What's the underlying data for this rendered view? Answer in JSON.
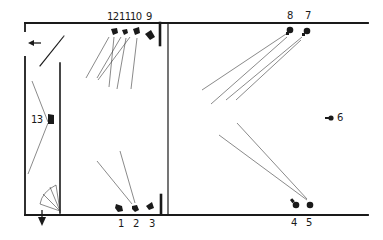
{
  "diagram": {
    "type": "floor-plan-camera-positions",
    "colors": {
      "ink": "#1a1a1a",
      "sight_line": "#3a3a3a",
      "background": "#ffffff"
    },
    "cameras": [
      {
        "id": "1",
        "label": "1",
        "x": 118,
        "y": 208,
        "label_x": 118,
        "label_y": 225
      },
      {
        "id": "2",
        "label": "2",
        "x": 135,
        "y": 209,
        "label_x": 133,
        "label_y": 225
      },
      {
        "id": "3",
        "label": "3",
        "x": 150,
        "y": 206,
        "label_x": 150,
        "label_y": 225
      },
      {
        "id": "4",
        "label": "4",
        "x": 296,
        "y": 204,
        "label_x": 292,
        "label_y": 224
      },
      {
        "id": "5",
        "label": "5",
        "x": 310,
        "y": 205,
        "label_x": 307,
        "label_y": 224
      },
      {
        "id": "6",
        "label": "6",
        "x": 330,
        "y": 118,
        "label_x": 338,
        "label_y": 113
      },
      {
        "id": "7",
        "label": "7",
        "x": 307,
        "y": 31,
        "label_x": 305,
        "label_y": 11
      },
      {
        "id": "8",
        "label": "8",
        "x": 290,
        "y": 30,
        "label_x": 287,
        "label_y": 11
      },
      {
        "id": "9",
        "label": "9",
        "x": 150,
        "y": 35,
        "label_x": 145,
        "label_y": 12
      },
      {
        "id": "10",
        "label": "10",
        "x": 136,
        "y": 31,
        "label_x": 130,
        "label_y": 12
      },
      {
        "id": "11",
        "label": "11",
        "x": 124,
        "y": 31,
        "label_x": 118,
        "label_y": 12
      },
      {
        "id": "12",
        "label": "12",
        "x": 114,
        "y": 31,
        "label_x": 104,
        "label_y": 12
      },
      {
        "id": "13",
        "label": "13",
        "x": 50,
        "y": 120,
        "label_x": 31,
        "label_y": 115
      }
    ],
    "entrance_arrow": {
      "label": "left-arrow",
      "x": 33,
      "y": 43
    },
    "exit_arrow": {
      "label": "down-arrow",
      "x": 42,
      "y": 218
    }
  }
}
